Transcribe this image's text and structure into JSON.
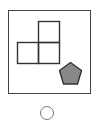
{
  "option": {
    "label": "",
    "selected": false
  },
  "figure": {
    "frame_color": "#444444",
    "square_stroke": "#333333",
    "pentagon_fill": "#888888",
    "pentagon_stroke": "#333333",
    "squares": [
      {
        "x": 38,
        "y": 21,
        "size": 21
      },
      {
        "x": 17,
        "y": 42,
        "size": 21
      },
      {
        "x": 38,
        "y": 42,
        "size": 21
      }
    ],
    "shape": "pentagon"
  }
}
